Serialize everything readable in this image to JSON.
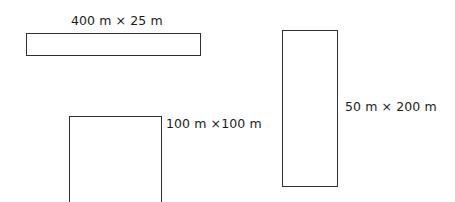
{
  "diagram": {
    "background_color": "#ffffff",
    "stroke_color": "#2f2f2f",
    "text_color": "#1c1c1c",
    "shapes": [
      {
        "id": "wide-bar",
        "label": "400 m × 25 m",
        "width_m": 400,
        "height_m": 25,
        "orientation": "horizontal",
        "label_position": "above",
        "clipped": false
      },
      {
        "id": "square",
        "label": "100 m ×100 m",
        "width_m": 100,
        "height_m": 100,
        "orientation": "square",
        "label_position": "right-of-top-corner",
        "clipped": true
      },
      {
        "id": "tall",
        "label": "50 m × 200 m",
        "width_m": 50,
        "height_m": 200,
        "orientation": "vertical",
        "label_position": "right-middle",
        "clipped": false
      }
    ]
  }
}
